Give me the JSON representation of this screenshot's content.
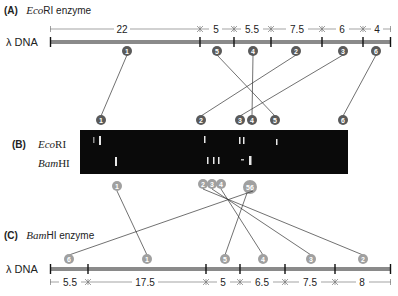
{
  "panelA": {
    "letter": "(A)",
    "enzyme_italic": "Eco",
    "enzyme_rest": "RI enzyme",
    "dna_label": "λ DNA",
    "segments": [
      "22",
      "5",
      "5.5",
      "7.5",
      "6",
      "4"
    ],
    "fragment_labels": [
      "1",
      "5",
      "4",
      "2",
      "3",
      "6"
    ]
  },
  "panelB": {
    "letter": "(B)",
    "lane1_italic": "Eco",
    "lane1_rest": "RI",
    "lane2_italic": "Bam",
    "lane2_rest": "HI",
    "top_labels": [
      "1",
      "2",
      "3",
      "4",
      "5",
      "6"
    ],
    "bottom_labels": [
      "1",
      "2",
      "3",
      "4",
      "56"
    ]
  },
  "panelC": {
    "letter": "(C)",
    "enzyme_italic": "Bam",
    "enzyme_rest": "HI enzyme",
    "dna_label": "λ DNA",
    "segments": [
      "5.5",
      "17.5",
      "5",
      "6.5",
      "7.5",
      "8"
    ],
    "fragment_labels": [
      "6",
      "1",
      "5",
      "4",
      "3",
      "2"
    ]
  },
  "colors": {
    "dna_bar": "#8a8a8a",
    "circle_dark": "#5a5a5a",
    "circle_light": "#a0a0a0",
    "gel": "#0a0a0a",
    "band": "#e8e8e8"
  }
}
